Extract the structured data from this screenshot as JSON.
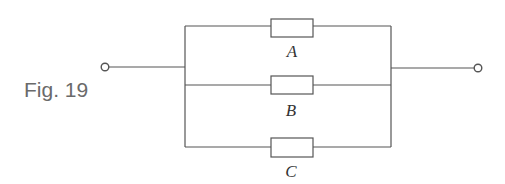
{
  "figure": {
    "caption": "Fig. 19"
  },
  "circuit": {
    "type": "parallel",
    "components": [
      {
        "label": "A",
        "kind": "resistor"
      },
      {
        "label": "B",
        "kind": "resistor"
      },
      {
        "label": "C",
        "kind": "resistor"
      }
    ],
    "terminals": [
      "left-terminal",
      "right-terminal"
    ]
  },
  "colors": {
    "line": "#555555",
    "caption": "#6a6a6a"
  }
}
